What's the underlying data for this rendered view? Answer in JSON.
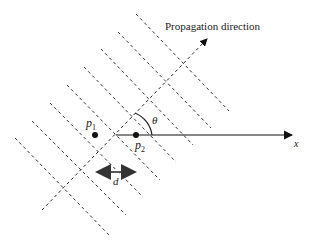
{
  "diagram": {
    "title_label": "Propagation direction",
    "axis_label": "x",
    "angle_label": "θ",
    "distance_label": "d",
    "points": [
      {
        "name": "p",
        "sub": "1"
      },
      {
        "name": "p",
        "sub": "2"
      }
    ],
    "wavefront_count": 8,
    "colors": {
      "line": "#222222",
      "arrow": "#555555"
    }
  }
}
